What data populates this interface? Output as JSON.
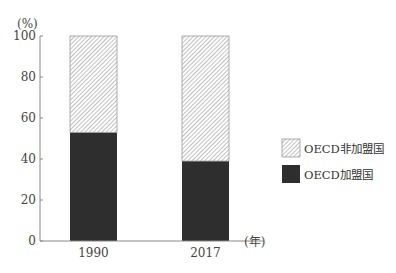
{
  "chart_data": {
    "type": "bar",
    "stacked": true,
    "title": "",
    "xlabel": "(年)",
    "ylabel": "(%)",
    "ylim": [
      0,
      100
    ],
    "yticks": [
      0,
      20,
      40,
      60,
      80,
      100
    ],
    "categories": [
      "1990",
      "2017"
    ],
    "series": [
      {
        "name": "OECD加盟国",
        "values": [
          53,
          39
        ],
        "fill": "solid",
        "color": "#2e2e2e"
      },
      {
        "name": "OECD非加盟国",
        "values": [
          47,
          61
        ],
        "fill": "hatch",
        "color": "#9a9a9a"
      }
    ],
    "grid": false,
    "legend_position": "right"
  },
  "axis": {
    "y_unit": "(%)",
    "x_unit": "(年)",
    "yticks": [
      "0",
      "20",
      "40",
      "60",
      "80",
      "100"
    ]
  },
  "legend": {
    "items": [
      {
        "label": "OECD非加盟国",
        "fill": "hatch"
      },
      {
        "label": "OECD加盟国",
        "fill": "solid"
      }
    ]
  }
}
